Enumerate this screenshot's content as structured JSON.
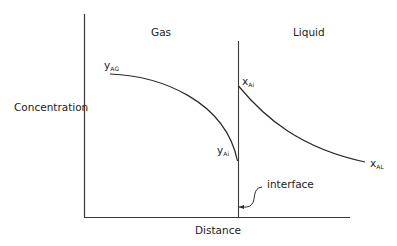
{
  "diagram": {
    "type": "two-film concentration profile",
    "axes": {
      "ylabel": "Concentration",
      "xlabel": "Distance"
    },
    "regions": [
      {
        "name": "gas",
        "label": "Gas"
      },
      {
        "name": "liquid",
        "label": "Liquid"
      }
    ],
    "variables": {
      "y_AG": {
        "base": "y",
        "sub": "AG"
      },
      "y_Ai": {
        "base": "y",
        "sub": "Ai"
      },
      "x_Ai": {
        "base": "x",
        "sub": "Ai"
      },
      "x_AL": {
        "base": "x",
        "sub": "AL"
      }
    },
    "interface_label": "interface",
    "curves": [
      {
        "name": "gas-phase-profile",
        "from": "y_AG",
        "to": "y_Ai",
        "shape": "concave-down decreasing toward interface"
      },
      {
        "name": "liquid-phase-profile",
        "from": "x_Ai",
        "to": "x_AL",
        "shape": "convex decreasing away from interface"
      }
    ],
    "colors": {
      "line": "#333333",
      "background": "#ffffff"
    }
  }
}
